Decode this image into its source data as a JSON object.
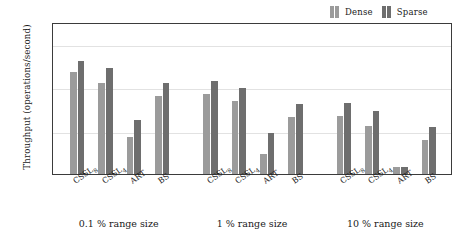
{
  "chart_data": {
    "type": "bar",
    "title": "",
    "subtitle": "",
    "xlabel": "",
    "ylabel": "Throughput (operations/second)",
    "yscale": "log",
    "ylim": [
      1,
      10000000
    ],
    "ytick_values": [
      1,
      100,
      10000,
      1000000
    ],
    "ytick_labels": [
      "10⁰",
      "10²",
      "10⁴",
      "10⁶"
    ],
    "ytick_mantissa": [
      "10",
      "10",
      "10",
      "10"
    ],
    "ytick_exponent": [
      "0",
      "2",
      "4",
      "6"
    ],
    "grid": true,
    "grid_axis": "y",
    "legend_position": "above-right",
    "categories": [
      "CSSL₈",
      "CSSL₄",
      "ART",
      "BS"
    ],
    "category_base": [
      "CSSL",
      "CSSL",
      "ART",
      "BS"
    ],
    "category_sub": [
      "8",
      "4",
      "",
      ""
    ],
    "groups": [
      {
        "caption": "0.1 % range size",
        "series": [
          {
            "name": "Dense",
            "values": [
              50000,
              16000,
              50,
              3800
            ]
          },
          {
            "name": "Sparse",
            "values": [
              160000,
              75000,
              320,
              16000
            ]
          }
        ]
      },
      {
        "caption": "1 % range size",
        "series": [
          {
            "name": "Dense",
            "values": [
              4800,
              2400,
              8,
              420
            ]
          },
          {
            "name": "Sparse",
            "values": [
              20000,
              9500,
              75,
              1600
            ]
          }
        ]
      },
      {
        "caption": "10 % range size",
        "series": [
          {
            "name": "Dense",
            "values": [
              470,
              170,
              2,
              38
            ]
          },
          {
            "name": "Sparse",
            "values": [
              1900,
              760,
              2.2,
              150
            ]
          }
        ]
      }
    ],
    "series_names": [
      "Dense",
      "Sparse"
    ],
    "series_colors": [
      "#9b9b9b",
      "#6e6e6e"
    ]
  },
  "legend": {
    "entries": [
      {
        "label": "Dense",
        "color": "#9b9b9b"
      },
      {
        "label": "Sparse",
        "color": "#6e6e6e"
      }
    ]
  },
  "axes": {
    "y_title": "Throughput (operations/second)"
  }
}
